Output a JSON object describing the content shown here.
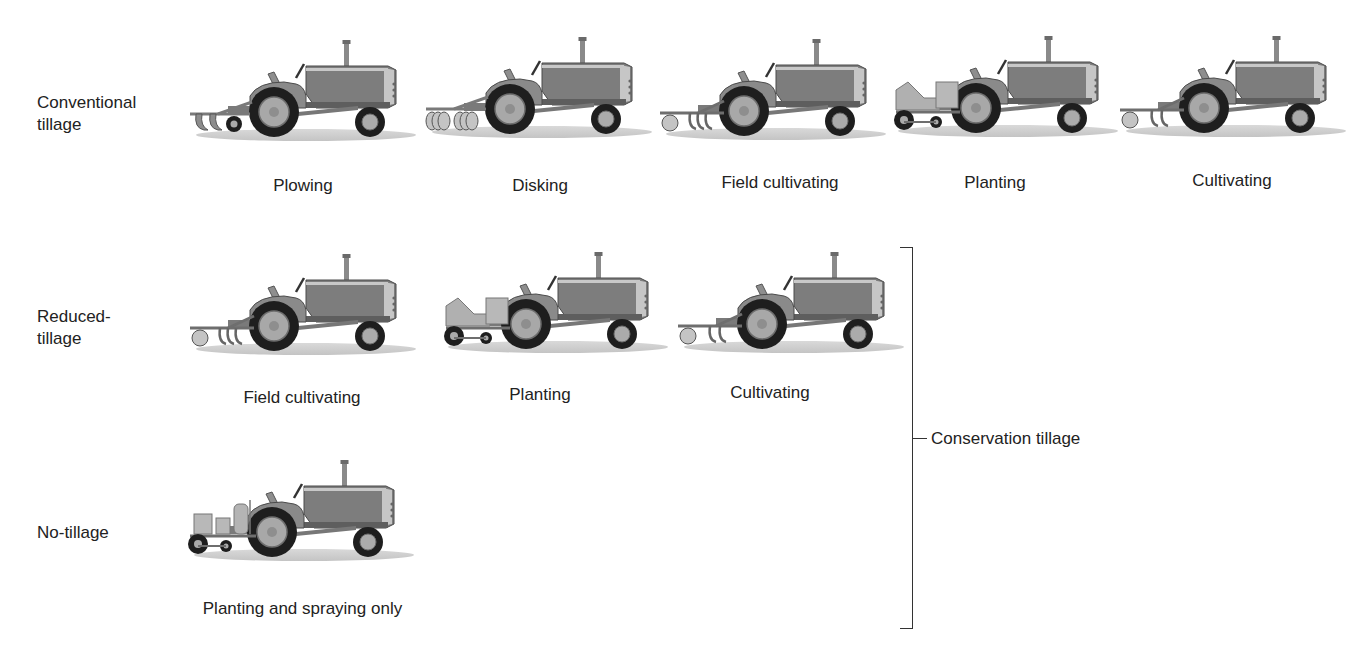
{
  "diagram": {
    "title": "",
    "colors": {
      "body": "#7d7d7d",
      "body_dark": "#5e5e5e",
      "body_light": "#bdbdbd",
      "tire": "#1e1e1e",
      "hub": "#a8a8a8",
      "ground": "#cfcfcf",
      "implement": "#9a9a9a",
      "text": "#222222",
      "bracket": "#333333"
    },
    "rows": [
      {
        "label": "Conventional tillage",
        "label_lines": [
          "Conventional",
          "tillage"
        ],
        "operations": [
          {
            "caption": "Plowing",
            "implement": "plow"
          },
          {
            "caption": "Disking",
            "implement": "disk"
          },
          {
            "caption": "Field cultivating",
            "implement": "field-cultivator"
          },
          {
            "caption": "Planting",
            "implement": "planter"
          },
          {
            "caption": "Cultivating",
            "implement": "cultivator"
          }
        ]
      },
      {
        "label": "Reduced-tillage",
        "label_lines": [
          "Reduced-",
          "tillage"
        ],
        "operations": [
          {
            "caption": "Field cultivating",
            "implement": "field-cultivator"
          },
          {
            "caption": "Planting",
            "implement": "planter"
          },
          {
            "caption": "Cultivating",
            "implement": "cultivator"
          }
        ]
      },
      {
        "label": "No-tillage",
        "label_lines": [
          "No-tillage"
        ],
        "operations": [
          {
            "caption": "Planting and spraying only",
            "implement": "planter-sprayer"
          }
        ]
      }
    ],
    "bracket": {
      "label": "Conservation tillage",
      "spans_rows": [
        "Reduced-tillage",
        "No-tillage"
      ]
    }
  }
}
